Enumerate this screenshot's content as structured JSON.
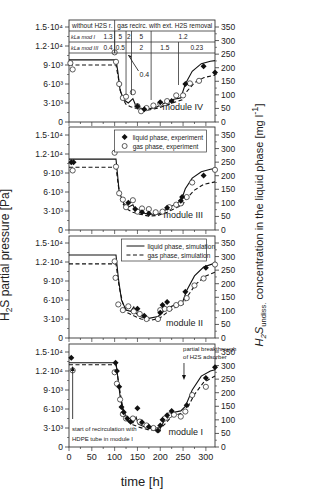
{
  "chart_data": {
    "type": "line",
    "title": "",
    "xlabel": "time [h]",
    "ylabel_left": "H2S partial pressure [Pa]",
    "ylabel_right": "H2S undiss. concentration in the liquid phase [mg l^-1]",
    "xlim": [
      0,
      320
    ],
    "xticks": [
      0,
      50,
      100,
      150,
      200,
      250,
      300
    ],
    "ylim_left": [
      0,
      15000
    ],
    "yticks_left": [
      "0",
      "3·10³",
      "6·10³",
      "9·10³",
      "1.2·10⁴",
      "1.5·10⁴"
    ],
    "ylim_right": [
      0,
      350
    ],
    "yticks_right": [
      "0",
      "50",
      "100",
      "150",
      "200",
      "250",
      "300",
      "350"
    ],
    "legend": [
      {
        "label": "liquid phase, experiment",
        "marker": "filled-diamond"
      },
      {
        "label": "gas phase, experiment",
        "marker": "open-circle"
      },
      {
        "label": "liquid phase, simulation",
        "style": "solid"
      },
      {
        "label": "gas phase, simulation",
        "style": "dashed"
      }
    ],
    "table": {
      "row0": [
        {
          "text": "without H2S r.",
          "span": [
            0,
            100
          ]
        },
        {
          "text": "gas recirc. with ext. H2S removal",
          "span": [
            100,
            320
          ]
        }
      ],
      "row1_label": "k_L a_mod I",
      "row1": [
        {
          "x": [
            0,
            100
          ],
          "text": "1.3"
        },
        {
          "x": [
            100,
            125
          ],
          "text": "5"
        },
        {
          "x": [
            125,
            137
          ],
          "text": "2"
        },
        {
          "x": [
            137,
            180
          ],
          "text": "5"
        },
        {
          "x": [
            180,
            320
          ],
          "text": "1.2"
        }
      ],
      "row2_label": "k_L a_mod III",
      "row2": [
        {
          "x": [
            0,
            100
          ],
          "text": "0.4"
        },
        {
          "x": [
            100,
            125
          ],
          "text": "0.5"
        },
        {
          "x": [
            125,
            137
          ],
          "text": ""
        },
        {
          "x": [
            137,
            180
          ],
          "text": "2"
        },
        {
          "x": [
            180,
            240
          ],
          "text": "1.5"
        },
        {
          "x": [
            240,
            320
          ],
          "text": "0.23"
        }
      ],
      "annotation": "0.4"
    },
    "panels": [
      {
        "name": "module IV",
        "sim_liquid": [
          [
            0,
            9800
          ],
          [
            103,
            9800
          ],
          [
            107,
            8000
          ],
          [
            112,
            5000
          ],
          [
            120,
            3500
          ],
          [
            130,
            3000
          ],
          [
            140,
            3700
          ],
          [
            145,
            2800
          ],
          [
            155,
            2200
          ],
          [
            170,
            2000
          ],
          [
            190,
            2300
          ],
          [
            210,
            3000
          ],
          [
            230,
            3600
          ],
          [
            245,
            3800
          ],
          [
            255,
            6000
          ],
          [
            270,
            8000
          ],
          [
            290,
            9200
          ],
          [
            310,
            9600
          ],
          [
            320,
            9700
          ]
        ],
        "sim_gas": [
          [
            0,
            9000
          ],
          [
            103,
            9000
          ],
          [
            108,
            7000
          ],
          [
            115,
            4000
          ],
          [
            125,
            2800
          ],
          [
            135,
            2400
          ],
          [
            145,
            2200
          ],
          [
            160,
            1900
          ],
          [
            175,
            1900
          ],
          [
            195,
            2200
          ],
          [
            215,
            2700
          ],
          [
            235,
            3200
          ],
          [
            248,
            3500
          ],
          [
            258,
            4800
          ],
          [
            275,
            6200
          ],
          [
            295,
            7000
          ],
          [
            320,
            7400
          ]
        ],
        "exp_liquid": [
          [
            150,
            2500
          ],
          [
            165,
            2000
          ],
          [
            200,
            3100
          ],
          [
            225,
            3300
          ],
          [
            255,
            6000
          ],
          [
            295,
            8800
          ],
          [
            320,
            7800
          ]
        ],
        "exp_gas": [
          [
            3,
            9300
          ],
          [
            8,
            8300
          ],
          [
            100,
            11000
          ],
          [
            103,
            9500
          ],
          [
            110,
            6000
          ],
          [
            118,
            3800
          ],
          [
            125,
            4000
          ],
          [
            140,
            4700
          ],
          [
            150,
            2500
          ],
          [
            158,
            1700
          ],
          [
            170,
            2200
          ],
          [
            185,
            2600
          ],
          [
            200,
            2900
          ],
          [
            215,
            3300
          ],
          [
            235,
            4200
          ],
          [
            250,
            4200
          ],
          [
            265,
            6100
          ],
          [
            285,
            6500
          ]
        ]
      },
      {
        "name": "module III",
        "sim_liquid": [
          [
            0,
            11200
          ],
          [
            103,
            11200
          ],
          [
            106,
            9000
          ],
          [
            110,
            6000
          ],
          [
            120,
            4200
          ],
          [
            130,
            3600
          ],
          [
            140,
            4000
          ],
          [
            145,
            3200
          ],
          [
            155,
            2800
          ],
          [
            175,
            2500
          ],
          [
            195,
            2500
          ],
          [
            215,
            3300
          ],
          [
            235,
            4200
          ],
          [
            245,
            4500
          ],
          [
            255,
            6500
          ],
          [
            270,
            8200
          ],
          [
            290,
            9200
          ],
          [
            310,
            9600
          ],
          [
            320,
            9700
          ]
        ],
        "sim_gas": [
          [
            0,
            9900
          ],
          [
            103,
            9900
          ],
          [
            108,
            7000
          ],
          [
            115,
            4500
          ],
          [
            125,
            3400
          ],
          [
            140,
            2800
          ],
          [
            155,
            2500
          ],
          [
            175,
            2200
          ],
          [
            195,
            2300
          ],
          [
            215,
            2800
          ],
          [
            235,
            3500
          ],
          [
            248,
            3900
          ],
          [
            258,
            5000
          ],
          [
            275,
            6300
          ],
          [
            295,
            7200
          ],
          [
            320,
            7600
          ]
        ],
        "exp_liquid": [
          [
            5,
            10700
          ],
          [
            10,
            10700
          ],
          [
            130,
            4300
          ],
          [
            145,
            3300
          ],
          [
            160,
            2800
          ],
          [
            175,
            2600
          ],
          [
            215,
            3500
          ],
          [
            245,
            4600
          ],
          [
            248,
            5200
          ],
          [
            295,
            8600
          ]
        ],
        "exp_gas": [
          [
            8,
            9400
          ],
          [
            100,
            12200
          ],
          [
            103,
            10000
          ],
          [
            110,
            5800
          ],
          [
            118,
            4800
          ],
          [
            125,
            3600
          ],
          [
            140,
            4700
          ],
          [
            150,
            2900
          ],
          [
            160,
            3400
          ],
          [
            175,
            3300
          ],
          [
            190,
            2800
          ],
          [
            205,
            2900
          ],
          [
            220,
            3600
          ],
          [
            235,
            4000
          ],
          [
            245,
            4200
          ],
          [
            258,
            5200
          ],
          [
            270,
            7500
          ],
          [
            320,
            9500
          ]
        ]
      },
      {
        "name": "module II",
        "sim_liquid": [
          [
            0,
            13100
          ],
          [
            103,
            13100
          ],
          [
            108,
            9500
          ],
          [
            115,
            6000
          ],
          [
            125,
            4400
          ],
          [
            135,
            4200
          ],
          [
            142,
            4900
          ],
          [
            147,
            3900
          ],
          [
            158,
            3300
          ],
          [
            175,
            3100
          ],
          [
            195,
            3400
          ],
          [
            215,
            4700
          ],
          [
            235,
            5300
          ],
          [
            248,
            5500
          ],
          [
            258,
            7500
          ],
          [
            275,
            9800
          ],
          [
            295,
            11200
          ],
          [
            315,
            11700
          ],
          [
            320,
            11800
          ]
        ],
        "sim_gas": [
          [
            0,
            11700
          ],
          [
            103,
            11700
          ],
          [
            110,
            8000
          ],
          [
            118,
            5500
          ],
          [
            128,
            4000
          ],
          [
            142,
            3500
          ],
          [
            158,
            3000
          ],
          [
            178,
            2800
          ],
          [
            198,
            3100
          ],
          [
            218,
            4200
          ],
          [
            238,
            5000
          ],
          [
            250,
            5300
          ],
          [
            260,
            6600
          ],
          [
            278,
            8500
          ],
          [
            300,
            9800
          ],
          [
            320,
            10400
          ]
        ],
        "exp_liquid": [
          [
            150,
            4600
          ],
          [
            165,
            3500
          ],
          [
            200,
            4000
          ],
          [
            205,
            5200
          ],
          [
            215,
            5700
          ],
          [
            255,
            7300
          ],
          [
            300,
            11100
          ]
        ],
        "exp_gas": [
          [
            100,
            12100
          ],
          [
            102,
            9500
          ],
          [
            108,
            5300
          ],
          [
            118,
            4400
          ],
          [
            130,
            5000
          ],
          [
            142,
            4200
          ],
          [
            155,
            3800
          ],
          [
            170,
            3000
          ],
          [
            195,
            3000
          ],
          [
            200,
            4400
          ],
          [
            210,
            4600
          ],
          [
            220,
            4600
          ],
          [
            235,
            5200
          ],
          [
            245,
            5500
          ],
          [
            258,
            6300
          ],
          [
            275,
            8300
          ],
          [
            295,
            9400
          ],
          [
            320,
            11600
          ]
        ]
      },
      {
        "name": "module I",
        "sim_liquid": [
          [
            0,
            13300
          ],
          [
            103,
            13300
          ],
          [
            107,
            11000
          ],
          [
            112,
            8000
          ],
          [
            120,
            5000
          ],
          [
            130,
            4000
          ],
          [
            140,
            3800
          ],
          [
            147,
            4700
          ],
          [
            152,
            3600
          ],
          [
            165,
            3200
          ],
          [
            185,
            2800
          ],
          [
            200,
            3000
          ],
          [
            210,
            4300
          ],
          [
            225,
            5400
          ],
          [
            245,
            5700
          ],
          [
            255,
            6400
          ],
          [
            270,
            9000
          ],
          [
            290,
            11200
          ],
          [
            310,
            12000
          ],
          [
            320,
            12200
          ]
        ],
        "sim_gas": [
          [
            0,
            13000
          ],
          [
            103,
            13000
          ],
          [
            110,
            9500
          ],
          [
            118,
            6200
          ],
          [
            128,
            4300
          ],
          [
            140,
            3500
          ],
          [
            155,
            3100
          ],
          [
            175,
            2700
          ],
          [
            195,
            2600
          ],
          [
            210,
            3600
          ],
          [
            225,
            4800
          ],
          [
            245,
            5300
          ],
          [
            258,
            6000
          ],
          [
            275,
            8300
          ],
          [
            295,
            10200
          ],
          [
            320,
            11200
          ]
        ],
        "exp_liquid": [
          [
            5,
            14100
          ],
          [
            102,
            13300
          ],
          [
            105,
            12000
          ],
          [
            110,
            9500
          ],
          [
            115,
            6300
          ],
          [
            120,
            5500
          ],
          [
            128,
            4500
          ],
          [
            135,
            4000
          ],
          [
            150,
            6100
          ],
          [
            160,
            3900
          ],
          [
            175,
            3200
          ],
          [
            195,
            2600
          ],
          [
            200,
            3400
          ],
          [
            205,
            4300
          ],
          [
            215,
            5000
          ],
          [
            225,
            5700
          ],
          [
            258,
            6600
          ],
          [
            300,
            10900
          ],
          [
            320,
            12600
          ]
        ],
        "exp_gas": [
          [
            8,
            12100
          ],
          [
            100,
            11800
          ],
          [
            105,
            10000
          ],
          [
            112,
            7500
          ],
          [
            118,
            5200
          ],
          [
            125,
            4500
          ],
          [
            140,
            4500
          ],
          [
            155,
            4000
          ],
          [
            170,
            3400
          ],
          [
            185,
            3000
          ],
          [
            195,
            2700
          ],
          [
            210,
            4500
          ],
          [
            220,
            5000
          ],
          [
            230,
            5100
          ],
          [
            245,
            4800
          ],
          [
            255,
            5600
          ],
          [
            270,
            8200
          ],
          [
            300,
            9500
          ]
        ]
      }
    ]
  },
  "labels": {
    "xlabel": "time [h]",
    "ylabel_left_main": "H",
    "ylabel_left_sub": "2",
    "ylabel_left_rest": "S partial pressure [Pa]",
    "ylabel_right_main1": "H",
    "ylabel_right_sub1": "2",
    "ylabel_right_main2": "S",
    "ylabel_right_sub2": "undiss.",
    "ylabel_right_rest": " concentration in the liquid phase [mg l",
    "ylabel_right_sup": "-1",
    "ylabel_right_end": "]",
    "legend_liquid_exp": "liquid phase, experiment",
    "legend_gas_exp": "gas phase, experiment",
    "legend_liquid_sim": "liquid phase, simulation",
    "legend_gas_sim": "gas phase, simulation",
    "annot_start_line1": "start of recirculation with",
    "annot_start_line2": "HDPE tube in module I",
    "annot_break_line1": "partial breakthrough",
    "annot_break_line2": "of H2S adsorber",
    "table_row0_a": "without H2S r.",
    "table_row0_b": "gas recirc. with ext. H2S removal",
    "table_row1_label": "kLa mod I",
    "table_row2_label": "kLa mod III",
    "table_annot": "0.4"
  }
}
